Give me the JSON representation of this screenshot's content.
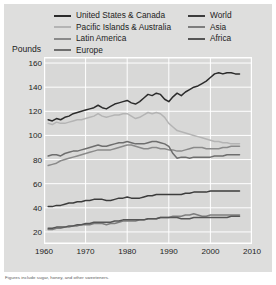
{
  "figure": {
    "ylabel": "Pounds",
    "footnote": "Figures include sugar, honey, and other sweeteners."
  },
  "legend": {
    "left_column": [
      {
        "label": "United States & Canada",
        "color": "#2b2b2b"
      },
      {
        "label": "Pacific Islands & Australia",
        "color": "#b4b4b4"
      },
      {
        "label": "Latin America",
        "color": "#8a8a8a"
      },
      {
        "label": "Europe",
        "color": "#6e6e6e"
      }
    ],
    "right_column": [
      {
        "label": "World",
        "color": "#3c3c3c"
      },
      {
        "label": "Asia",
        "color": "#7d7d7d"
      },
      {
        "label": "Africa",
        "color": "#555555"
      }
    ]
  },
  "chart_data": {
    "type": "line",
    "title": "",
    "xlabel": "",
    "ylabel": "Pounds",
    "xlim": [
      1960,
      2010
    ],
    "ylim": [
      10,
      165
    ],
    "xticks": [
      1960,
      1970,
      1980,
      1990,
      2000,
      2010
    ],
    "yticks": [
      20,
      40,
      60,
      80,
      100,
      120,
      140,
      160
    ],
    "grid": true,
    "legend_position": "above-plot",
    "x": [
      1961,
      1962,
      1963,
      1964,
      1965,
      1966,
      1967,
      1968,
      1969,
      1970,
      1971,
      1972,
      1973,
      1974,
      1975,
      1976,
      1977,
      1978,
      1979,
      1980,
      1981,
      1982,
      1983,
      1984,
      1985,
      1986,
      1987,
      1988,
      1989,
      1990,
      1991,
      1992,
      1993,
      1994,
      1995,
      1996,
      1997,
      1998,
      1999,
      2000,
      2001,
      2002,
      2003,
      2004,
      2005,
      2006,
      2007
    ],
    "series": [
      {
        "name": "United States & Canada",
        "color": "#2b2b2b",
        "values": [
          113,
          112,
          114,
          113,
          115,
          116,
          118,
          119,
          120,
          121,
          122,
          123,
          125,
          123,
          122,
          124,
          126,
          127,
          128,
          129,
          127,
          126,
          128,
          131,
          134,
          133,
          135,
          134,
          130,
          128,
          132,
          135,
          133,
          136,
          138,
          140,
          141,
          143,
          145,
          148,
          151,
          152,
          151,
          152,
          152,
          151,
          151
        ]
      },
      {
        "name": "Pacific Islands & Australia",
        "color": "#b4b4b4",
        "values": [
          110,
          109,
          111,
          110,
          110,
          111,
          112,
          113,
          113,
          114,
          115,
          116,
          118,
          116,
          115,
          116,
          117,
          117,
          118,
          118,
          116,
          114,
          115,
          117,
          119,
          118,
          119,
          118,
          115,
          110,
          107,
          104,
          103,
          102,
          101,
          100,
          99,
          98,
          97,
          96,
          95,
          95,
          94,
          94,
          93,
          93,
          93
        ]
      },
      {
        "name": "Latin America",
        "color": "#8a8a8a",
        "values": [
          75,
          76,
          77,
          79,
          80,
          81,
          82,
          83,
          84,
          85,
          86,
          87,
          88,
          88,
          88,
          88,
          89,
          90,
          91,
          92,
          92,
          91,
          90,
          89,
          89,
          90,
          90,
          89,
          89,
          88,
          88,
          87,
          87,
          88,
          89,
          90,
          90,
          90,
          89,
          89,
          89,
          89,
          90,
          90,
          91,
          91,
          91
        ]
      },
      {
        "name": "Europe",
        "color": "#6e6e6e",
        "values": [
          83,
          84,
          84,
          83,
          85,
          86,
          87,
          87,
          88,
          89,
          90,
          91,
          92,
          91,
          91,
          92,
          93,
          94,
          94,
          95,
          94,
          93,
          93,
          93,
          94,
          95,
          95,
          94,
          93,
          91,
          85,
          81,
          82,
          82,
          81,
          82,
          82,
          82,
          82,
          82,
          83,
          83,
          83,
          84,
          84,
          84,
          84
        ]
      },
      {
        "name": "World",
        "color": "#3c3c3c",
        "values": [
          41,
          41,
          42,
          42,
          43,
          44,
          44,
          45,
          45,
          46,
          46,
          47,
          47,
          47,
          46,
          46,
          47,
          48,
          48,
          49,
          48,
          48,
          48,
          49,
          50,
          50,
          51,
          51,
          51,
          51,
          51,
          51,
          51,
          52,
          52,
          53,
          53,
          53,
          53,
          54,
          54,
          54,
          54,
          54,
          54,
          54,
          54
        ]
      },
      {
        "name": "Asia",
        "color": "#7d7d7d",
        "values": [
          22,
          22,
          23,
          23,
          24,
          24,
          25,
          25,
          26,
          26,
          26,
          27,
          27,
          27,
          26,
          27,
          27,
          28,
          29,
          29,
          29,
          29,
          30,
          30,
          31,
          31,
          31,
          32,
          32,
          32,
          33,
          33,
          33,
          34,
          34,
          35,
          34,
          33,
          33,
          34,
          34,
          34,
          34,
          34,
          34,
          34,
          34
        ]
      },
      {
        "name": "Africa",
        "color": "#555555",
        "values": [
          23,
          23,
          24,
          24,
          24,
          25,
          25,
          26,
          26,
          27,
          27,
          28,
          28,
          28,
          28,
          28,
          29,
          29,
          30,
          30,
          30,
          30,
          30,
          30,
          31,
          31,
          31,
          32,
          32,
          32,
          32,
          32,
          31,
          31,
          31,
          32,
          32,
          32,
          32,
          32,
          32,
          32,
          32,
          32,
          33,
          33,
          33
        ]
      }
    ]
  }
}
